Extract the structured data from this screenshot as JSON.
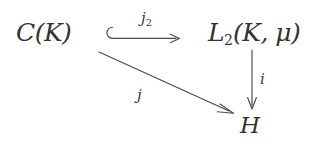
{
  "diagram": {
    "type": "commutative-diagram",
    "background_color": "#ffffff",
    "ink_color": "#3a3a3a",
    "nodes": [
      {
        "id": "top-left",
        "symbol": "C",
        "style": "calligraphic",
        "argument": "(K)",
        "full_text": "ᴄ(K)"
      },
      {
        "id": "top-right",
        "symbol": "L",
        "style": "calligraphic",
        "subscript": "2",
        "argument": "(K, μ)",
        "full_text": "ℒ₂(K, μ)"
      },
      {
        "id": "bottom-right",
        "symbol": "H",
        "style": "italic",
        "full_text": "H"
      }
    ],
    "arrows": [
      {
        "id": "inclusion",
        "from": "top-left",
        "to": "top-right",
        "kind": "hooked-arrow",
        "direction": "right",
        "label": "j",
        "label_subscript": "2"
      },
      {
        "id": "map-i",
        "from": "top-right",
        "to": "bottom-right",
        "kind": "arrow",
        "direction": "down",
        "label": "i",
        "label_subscript": ""
      },
      {
        "id": "map-j",
        "from": "top-left",
        "to": "bottom-right",
        "kind": "arrow",
        "direction": "diagonal-down-right",
        "label": "j",
        "label_subscript": ""
      }
    ],
    "labels": {
      "node_ck_symbol": "C",
      "node_ck_arg": "(K)",
      "node_l2_symbol": "L",
      "node_l2_sub": "2",
      "node_l2_arg": "(K, μ)",
      "node_h": "H",
      "arrow_j2_base": "j",
      "arrow_j2_sub": "2",
      "arrow_i": "i",
      "arrow_j": "j"
    }
  }
}
